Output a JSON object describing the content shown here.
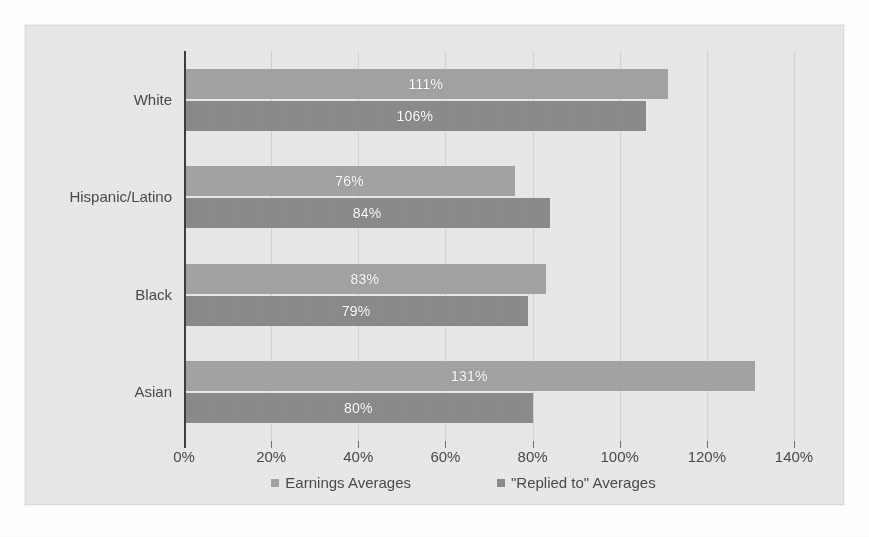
{
  "chart_data": {
    "type": "bar",
    "orientation": "horizontal",
    "title": "",
    "subtitle": "",
    "xlabel": "",
    "ylabel": "",
    "categories": [
      "White",
      "Hispanic/Latino",
      "Black",
      "Asian"
    ],
    "series": [
      {
        "name": "Earnings Averages",
        "color": "#a3a3a3",
        "values": [
          111,
          106,
          76,
          84
        ],
        "value_labels": [
          "111%",
          "106%",
          "76%",
          "84%"
        ]
      },
      {
        "name": "\"Replied to\" Averages",
        "color": "#8b8b8b",
        "values": [
          83,
          79,
          131,
          80
        ],
        "value_labels": [
          "83%",
          "79%",
          "131%",
          "80%"
        ]
      }
    ],
    "grouped_values": [
      {
        "category": "White",
        "earnings": 111,
        "earnings_label": "111%",
        "replied": 106,
        "replied_label": "106%"
      },
      {
        "category": "Hispanic/Latino",
        "earnings": 76,
        "earnings_label": "76%",
        "replied": 84,
        "replied_label": "84%"
      },
      {
        "category": "Black",
        "earnings": 83,
        "earnings_label": "83%",
        "replied": 79,
        "replied_label": "79%"
      },
      {
        "category": "Asian",
        "earnings": 131,
        "earnings_label": "131%",
        "replied": 80,
        "replied_label": "80%"
      }
    ],
    "xlim": [
      0,
      140
    ],
    "xtick_values": [
      0,
      20,
      40,
      60,
      80,
      100,
      120,
      140
    ],
    "xtick_labels": [
      "0%",
      "20%",
      "40%",
      "60%",
      "80%",
      "100%",
      "120%",
      "140%"
    ],
    "grid": true,
    "grid_axis": "x",
    "legend_position": "bottom",
    "legend": [
      {
        "label": "Earnings Averages",
        "color": "#a3a3a3"
      },
      {
        "label": "\"Replied to\" Averages",
        "color": "#8b8b8b"
      }
    ],
    "value_label_color": "#ffffff",
    "plot_background": "#e9e9e9",
    "axis_color": "#3d3d3d",
    "gridline_color": "#d2d2d2",
    "tick_label_color": "#4a4a4a"
  }
}
